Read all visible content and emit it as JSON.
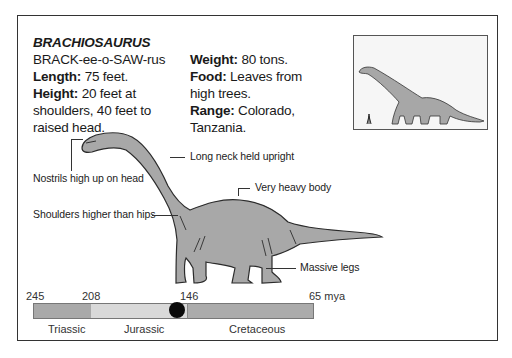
{
  "card": {
    "title": "BRACHIOSAURUS",
    "pronunciation": "BRACK-ee-o-SAW-rus",
    "facts_left": [
      {
        "label": "Length:",
        "value": " 75 feet."
      },
      {
        "label": "Height:",
        "value": " 20 feet at"
      },
      {
        "label": "",
        "value": "shoulders, 40 feet to"
      },
      {
        "label": "",
        "value": "raised head."
      }
    ],
    "facts_right": [
      {
        "label": "Weight:",
        "value": " 80 tons."
      },
      {
        "label": "Food:",
        "value": " Leaves from"
      },
      {
        "label": "",
        "value": "high trees."
      },
      {
        "label": "Range:",
        "value": " Colorado,"
      },
      {
        "label": "",
        "value": "Tanzania."
      }
    ]
  },
  "annotations": {
    "nostrils": "Nostrils high up on head",
    "neck": "Long neck held upright",
    "body": "Very heavy body",
    "shoulders": "Shoulders higher than hips",
    "legs": "Massive legs"
  },
  "inset": {
    "description": "Size comparison: dinosaur silhouette vs human"
  },
  "timeline": {
    "ticks": [
      "245",
      "208",
      "146",
      "65 mya"
    ],
    "periods": [
      {
        "name": "Triassic",
        "color": "#a9a9a9"
      },
      {
        "name": "Jurassic",
        "color": "#d9d9d9"
      },
      {
        "name": "Cretaceous",
        "color": "#ababab"
      }
    ],
    "marker": "Late Jurassic (~150 mya)"
  }
}
